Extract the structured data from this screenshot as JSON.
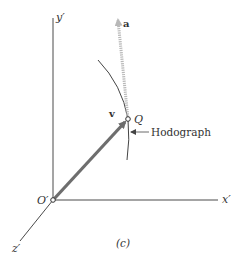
{
  "figure": {
    "caption": "(c)",
    "origin_label": "O′",
    "axes": {
      "x_label": "x′",
      "y_label": "y′",
      "z_label": "z′"
    },
    "vectors": {
      "velocity_label": "v",
      "acceleration_label": "a"
    },
    "point_label": "Q",
    "curve_label": "Hodograph"
  },
  "colors": {
    "axis": "#4a4a4a",
    "velocity": "#6e6e6e",
    "acceleration": "#b8b8b8",
    "curve": "#444444",
    "text": "#333333"
  }
}
